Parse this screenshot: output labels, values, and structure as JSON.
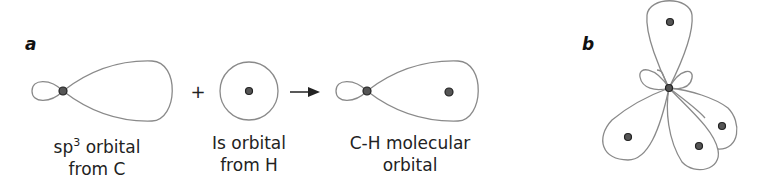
{
  "panels": {
    "a": {
      "label": "a",
      "items": [
        {
          "label_prefix": "sp",
          "label_sup": "3",
          "label_line1_rest": " orbital",
          "label_line2": "from C"
        },
        {
          "label_line1": "Is orbital",
          "label_line2": "from H"
        },
        {
          "label_line1": "C-H molecular",
          "label_line2": "orbital"
        }
      ],
      "operator_plus": "+",
      "operator_arrow": "→"
    },
    "b": {
      "label": "b",
      "description": "tetrahedral sp3 hybrid orbitals of carbon"
    }
  },
  "colors": {
    "outline": "#8a8a8a",
    "nucleus": "#555555"
  }
}
